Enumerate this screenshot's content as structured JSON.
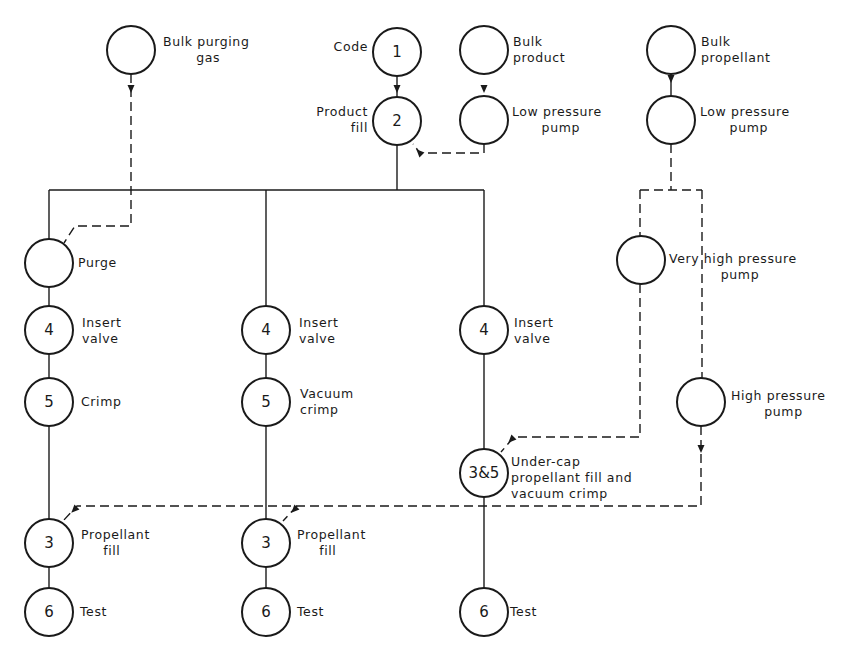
{
  "diagram": {
    "type": "process-flow",
    "nodes": [
      {
        "id": "bulk-purging-gas",
        "code": "",
        "cx": 131,
        "cy": 50,
        "label": [
          "Bulk purging",
          "gas"
        ],
        "lx": 163,
        "ly": 46,
        "align": "start"
      },
      {
        "id": "code",
        "code": "1",
        "cx": 397,
        "cy": 52,
        "label": [
          "Code"
        ],
        "lx": 368,
        "ly": 51,
        "align": "end"
      },
      {
        "id": "bulk-product",
        "code": "",
        "cx": 484,
        "cy": 50,
        "label": [
          "Bulk",
          "product"
        ],
        "lx": 513,
        "ly": 46,
        "align": "start"
      },
      {
        "id": "bulk-propellant",
        "code": "",
        "cx": 671,
        "cy": 50,
        "label": [
          "Bulk",
          "propellant"
        ],
        "lx": 701,
        "ly": 46,
        "align": "start"
      },
      {
        "id": "product-fill",
        "code": "2",
        "cx": 397,
        "cy": 121,
        "label": [
          "Product",
          "fill"
        ],
        "lx": 368,
        "ly": 116,
        "align": "end"
      },
      {
        "id": "low-pressure-pump-product",
        "code": "",
        "cx": 484,
        "cy": 120,
        "label": [
          "Low pressure",
          "pump"
        ],
        "lx": 512,
        "ly": 116,
        "align": "start"
      },
      {
        "id": "low-pressure-pump-propellant",
        "code": "",
        "cx": 671,
        "cy": 120,
        "label": [
          "Low pressure",
          "pump"
        ],
        "lx": 700,
        "ly": 116,
        "align": "start"
      },
      {
        "id": "purge",
        "code": "",
        "cx": 49,
        "cy": 263,
        "label": [
          "Purge"
        ],
        "lx": 78,
        "ly": 267,
        "align": "start"
      },
      {
        "id": "very-high-pressure-pump",
        "code": "",
        "cx": 641,
        "cy": 260,
        "label": [
          "Very high pressure",
          "pump"
        ],
        "lx": 669,
        "ly": 263,
        "align": "start"
      },
      {
        "id": "insert-valve-a",
        "code": "4",
        "cx": 49,
        "cy": 330,
        "label": [
          "Insert",
          "valve"
        ],
        "lx": 82,
        "ly": 327,
        "align": "start"
      },
      {
        "id": "insert-valve-b",
        "code": "4",
        "cx": 266,
        "cy": 330,
        "label": [
          "Insert",
          "valve"
        ],
        "lx": 299,
        "ly": 327,
        "align": "start"
      },
      {
        "id": "insert-valve-c",
        "code": "4",
        "cx": 484,
        "cy": 330,
        "label": [
          "Insert",
          "valve"
        ],
        "lx": 514,
        "ly": 327,
        "align": "start"
      },
      {
        "id": "crimp",
        "code": "5",
        "cx": 49,
        "cy": 402,
        "label": [
          "Crimp"
        ],
        "lx": 81,
        "ly": 406,
        "align": "start"
      },
      {
        "id": "vacuum-crimp",
        "code": "5",
        "cx": 266,
        "cy": 402,
        "label": [
          "Vacuum",
          "crimp"
        ],
        "lx": 300,
        "ly": 398,
        "align": "start"
      },
      {
        "id": "high-pressure-pump",
        "code": "",
        "cx": 701,
        "cy": 402,
        "label": [
          "High pressure",
          "pump"
        ],
        "lx": 731,
        "ly": 400,
        "align": "start"
      },
      {
        "id": "undercap-fill-vacuum-crimp",
        "code": "3&5",
        "cx": 484,
        "cy": 473,
        "label": [
          "Under-cap",
          "propellant fill and",
          "vacuum crimp"
        ],
        "lx": 511,
        "ly": 466,
        "align": "start"
      },
      {
        "id": "propellant-fill-a",
        "code": "3",
        "cx": 49,
        "cy": 543,
        "label": [
          "Propellant",
          "fill"
        ],
        "lx": 81,
        "ly": 539,
        "align": "start"
      },
      {
        "id": "propellant-fill-b",
        "code": "3",
        "cx": 266,
        "cy": 543,
        "label": [
          "Propellant",
          "fill"
        ],
        "lx": 297,
        "ly": 539,
        "align": "start"
      },
      {
        "id": "test-a",
        "code": "6",
        "cx": 49,
        "cy": 612,
        "label": [
          "Test"
        ],
        "lx": 80,
        "ly": 616,
        "align": "start"
      },
      {
        "id": "test-b",
        "code": "6",
        "cx": 266,
        "cy": 612,
        "label": [
          "Test"
        ],
        "lx": 297,
        "ly": 616,
        "align": "start"
      },
      {
        "id": "test-c",
        "code": "6",
        "cx": 484,
        "cy": 612,
        "label": [
          "Test"
        ],
        "lx": 510,
        "ly": 616,
        "align": "start"
      }
    ],
    "solid_paths": [
      "M397 76 L397 97",
      "M397 145 L397 190",
      "M49 190 L484 190",
      "M49 190 L49 239",
      "M266 190 L266 306",
      "M484 190 L484 306",
      "M671 74 L671 96",
      "M49 287 L49 306",
      "M49 354 L49 378",
      "M49 426 L49 519",
      "M49 567 L49 588",
      "M266 354 L266 378",
      "M266 426 L266 519",
      "M266 567 L266 588",
      "M484 354 L484 449",
      "M484 497 L484 588"
    ],
    "dashed_paths": [
      "M131 74 L131 226 L75 226 L64 243",
      "M484 144 L484 153 L420 153 L413 144",
      "M671 144 L671 190",
      "M640 190 L702 190",
      "M640 190 L640 236",
      "M702 190 L702 378",
      "M640 284 L640 437 L514 437 L501 452",
      "M701 426 L701 506 L77 506 L63 521",
      "M297 506 L283 521"
    ],
    "arrows": [
      {
        "x": 131,
        "y": 92,
        "dir": "down"
      },
      {
        "x": 397,
        "y": 92,
        "dir": "down"
      },
      {
        "x": 484,
        "y": 92,
        "dir": "down"
      },
      {
        "x": 671,
        "y": 82,
        "dir": "down"
      },
      {
        "x": 701,
        "y": 452,
        "dir": "down"
      },
      {
        "x": 417,
        "y": 150,
        "dir": "up-left"
      },
      {
        "x": 509,
        "y": 442,
        "dir": "down-left"
      },
      {
        "x": 72,
        "y": 512,
        "dir": "down-left"
      },
      {
        "x": 292,
        "y": 512,
        "dir": "down-left"
      }
    ]
  },
  "caption": ""
}
